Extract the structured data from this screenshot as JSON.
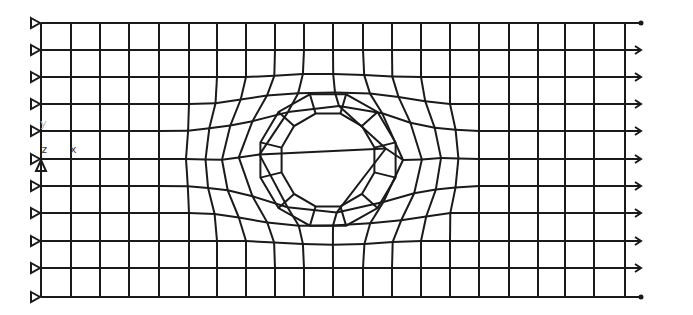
{
  "diagram": {
    "type": "finite-element-mesh",
    "colors": {
      "mesh_line": "#1a1a1a",
      "background": "#ffffff",
      "axis_label": "#333333"
    },
    "plate": {
      "left": 41,
      "right": 625,
      "top": 23,
      "bottom": 297
    },
    "hole": {
      "cx": 328,
      "cy": 160,
      "r": 48,
      "segments": 12
    },
    "grid": {
      "columns_x": [
        41,
        71,
        100,
        129,
        159,
        189,
        217,
        246,
        275,
        304,
        333,
        363,
        392,
        421,
        450,
        479,
        509,
        538,
        565,
        594,
        625
      ],
      "rows_y": [
        23,
        50,
        77,
        104,
        131,
        159,
        186,
        213,
        241,
        268,
        297
      ]
    },
    "boundary_conditions": {
      "left_supports": {
        "type": "roller-triangle",
        "count": 11,
        "x": 33
      },
      "pin_support": {
        "x": 41,
        "y": 166
      },
      "right_loads": {
        "type": "arrow",
        "count": 11,
        "length": 16
      }
    },
    "axes": {
      "z_label": "z",
      "x_label": "x",
      "y_label": "y"
    }
  }
}
